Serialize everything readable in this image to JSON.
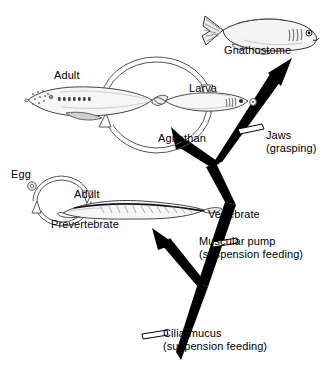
{
  "diagram": {
    "type": "cladogram-with-life-cycles",
    "background_color": "#ffffff",
    "line_color": "#000000"
  },
  "taxa": {
    "gnathostome": {
      "label": "Gnathostome",
      "icon": "jawed-fish-icon"
    },
    "agnathan": {
      "label": "Agnathan",
      "icon": "jawless-fish-icon"
    },
    "prevertebrate": {
      "label": "Prevertebrate",
      "icon": "amphioxus-icon"
    }
  },
  "life_cycles": {
    "agnathan_cycle": {
      "name": "agnathan-life-cycle",
      "stages": [
        {
          "label": "Adult",
          "icon": "adult-lamprey-icon"
        },
        {
          "label": "Larva",
          "icon": "ammocoete-larva-icon"
        }
      ],
      "egg_marker": "egg-dot-icon"
    },
    "prevertebrate_cycle": {
      "name": "prevertebrate-life-cycle",
      "stages": [
        {
          "label": "Egg",
          "icon": "egg-icon"
        },
        {
          "label": "Adult",
          "icon": "adult-amphioxus-icon"
        }
      ]
    }
  },
  "branch_labels": {
    "vertebrate": "Vertebrate"
  },
  "character_states": [
    {
      "id": "jaws",
      "line1": "Jaws",
      "line2": "(grasping)",
      "marker": "character-bar-icon"
    },
    {
      "id": "muscular-pump",
      "line1": "Muscular pump",
      "line2": "(suspension feeding)",
      "marker": "character-bar-icon"
    },
    {
      "id": "cilia-mucus",
      "line1": "Cilia-mucus",
      "line2": "(suspension feeding)",
      "marker": "character-bar-icon"
    }
  ]
}
